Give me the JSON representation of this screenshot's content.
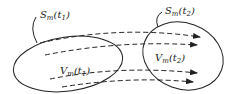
{
  "diagram": {
    "labels": {
      "surface_t1": {
        "base": "S",
        "sub": "m",
        "arg": "(t",
        "argsub": "1",
        "close": ")"
      },
      "surface_t2": {
        "base": "S",
        "sub": "m",
        "arg": "(t",
        "argsub": "2",
        "close": ")"
      },
      "volume_t1": {
        "base": "V",
        "sub": "m",
        "arg": "(t",
        "argsub": "1",
        "close": ")"
      },
      "volume_t2": {
        "base": "V",
        "sub": "m",
        "arg": "(t",
        "argsub": "2",
        "close": ")"
      }
    },
    "colors": {
      "stroke": "#222222",
      "background": "#ffffff"
    },
    "arrow_count": 4
  }
}
